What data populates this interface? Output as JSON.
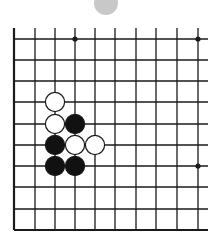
{
  "diagram": {
    "type": "go-board-fragment",
    "colors": {
      "line": "#1a1a1a",
      "black_stone": "#111111",
      "white_stone": "#ffffff",
      "ghost_stone": "#c8c8c8"
    },
    "grid": {
      "x": [
        14,
        35,
        55,
        75,
        95,
        115,
        136,
        156,
        177,
        198
      ],
      "y": [
        39,
        60,
        81,
        102,
        124,
        145,
        166,
        187,
        209,
        230
      ],
      "left_edge": true,
      "bottom_edge": true,
      "top_extend": 28,
      "right_extend": 208
    },
    "star_points": [
      [
        3,
        0
      ],
      [
        9,
        0
      ],
      [
        9,
        6
      ]
    ],
    "stones": [
      {
        "color": "white",
        "col": 2,
        "row": 3
      },
      {
        "color": "white",
        "col": 2,
        "row": 4
      },
      {
        "color": "black",
        "col": 3,
        "row": 4
      },
      {
        "color": "black",
        "col": 2,
        "row": 5
      },
      {
        "color": "white",
        "col": 3,
        "row": 5
      },
      {
        "color": "white",
        "col": 4,
        "row": 5
      },
      {
        "color": "black",
        "col": 2,
        "row": 6
      },
      {
        "color": "black",
        "col": 3,
        "row": 6
      }
    ]
  }
}
